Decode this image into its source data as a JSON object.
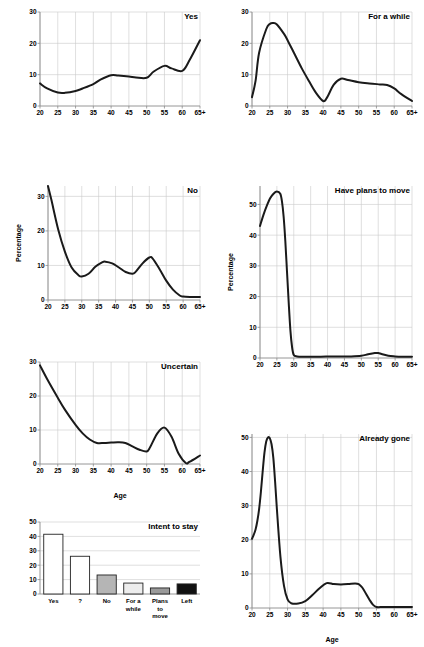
{
  "figure": {
    "axis_label_x": "Age",
    "axis_label_y": "Percentage",
    "line_color": "#1a1a1a",
    "grid_color": "#c9c9c9",
    "axis_color": "#8a8a8a"
  },
  "panels": [
    {
      "name": "yes",
      "title": "Yes",
      "xlabel": "",
      "ylabel": ""
    },
    {
      "name": "for-a-while",
      "title": "For a while",
      "xlabel": "",
      "ylabel": ""
    },
    {
      "name": "no",
      "title": "No",
      "xlabel": "",
      "ylabel": "Percentage"
    },
    {
      "name": "have-plans-to-move",
      "title": "Have plans to move",
      "xlabel": "",
      "ylabel": "Percentage"
    },
    {
      "name": "uncertain",
      "title": "Uncertain",
      "xlabel": "Age",
      "ylabel": ""
    },
    {
      "name": "intent-to-stay",
      "title": "Intent to stay",
      "xlabel": "",
      "ylabel": ""
    },
    {
      "name": "already-gone",
      "title": "Already gone",
      "xlabel": "Age",
      "ylabel": ""
    }
  ],
  "chart_data": [
    {
      "type": "line",
      "name": "yes",
      "title": "Yes",
      "xlabel": "",
      "ylabel": "Percentage",
      "xticklabels": [
        "20",
        "25",
        "30",
        "35",
        "40",
        "45",
        "50",
        "55",
        "60",
        "65+"
      ],
      "yticklabels": [
        "0",
        "10",
        "20",
        "30"
      ],
      "xlim": [
        20,
        65
      ],
      "ylim": [
        0,
        30
      ],
      "yticks": [
        0,
        10,
        20,
        30
      ],
      "xticks": [
        20,
        25,
        30,
        35,
        40,
        45,
        50,
        55,
        60,
        65
      ],
      "grid": true,
      "x": [
        20,
        22,
        25,
        27,
        30,
        32,
        35,
        37,
        40,
        42,
        45,
        47,
        50,
        52,
        55,
        57,
        60,
        62,
        65
      ],
      "y": [
        7.2,
        5.6,
        4.3,
        4.2,
        4.8,
        5.6,
        7.0,
        8.4,
        9.8,
        9.7,
        9.4,
        9.1,
        9.0,
        11.0,
        12.8,
        12.0,
        11.2,
        14.5,
        21.0
      ]
    },
    {
      "type": "line",
      "name": "for-a-while",
      "title": "For a while",
      "xlabel": "",
      "ylabel": "Percentage",
      "xticklabels": [
        "20",
        "25",
        "30",
        "35",
        "40",
        "45",
        "50",
        "55",
        "60",
        "65+"
      ],
      "yticklabels": [
        "0",
        "10",
        "20",
        "30"
      ],
      "xlim": [
        20,
        65
      ],
      "ylim": [
        0,
        30
      ],
      "yticks": [
        0,
        10,
        20,
        30
      ],
      "xticks": [
        20,
        25,
        30,
        35,
        40,
        45,
        50,
        55,
        60,
        65
      ],
      "grid": true,
      "x": [
        20,
        21,
        22,
        24,
        25,
        26,
        27,
        29,
        30,
        32,
        34,
        36,
        38,
        40,
        41,
        43,
        45,
        47,
        50,
        53,
        56,
        58,
        60,
        62,
        65
      ],
      "y": [
        2.8,
        8.0,
        17.0,
        24.5,
        26.2,
        26.5,
        26.0,
        23.0,
        21.0,
        16.5,
        12.0,
        8.0,
        4.2,
        1.6,
        2.5,
        6.8,
        8.7,
        8.3,
        7.6,
        7.2,
        6.9,
        6.7,
        5.6,
        3.8,
        1.6
      ]
    },
    {
      "type": "line",
      "name": "no",
      "title": "No",
      "xlabel": "",
      "ylabel": "Percentage",
      "xticklabels": [
        "20",
        "25",
        "30",
        "35",
        "40",
        "45",
        "50",
        "55",
        "60",
        "65+"
      ],
      "yticklabels": [
        "0",
        "10",
        "20",
        "30"
      ],
      "xlim": [
        20,
        65
      ],
      "ylim": [
        0,
        33
      ],
      "yticks": [
        0,
        10,
        20,
        30
      ],
      "xticks": [
        20,
        25,
        30,
        35,
        40,
        45,
        50,
        55,
        60,
        65
      ],
      "grid": true,
      "x": [
        20,
        21,
        23,
        25,
        27,
        29,
        30,
        32,
        34,
        36,
        37,
        39,
        41,
        43,
        45,
        46,
        48,
        50,
        51,
        53,
        55,
        57,
        59,
        60,
        62,
        65
      ],
      "y": [
        33.0,
        29.0,
        20.5,
        14.0,
        9.4,
        7.2,
        6.8,
        7.6,
        9.6,
        10.9,
        11.1,
        10.6,
        9.4,
        8.1,
        7.6,
        8.2,
        10.6,
        12.3,
        12.0,
        9.0,
        5.6,
        3.0,
        1.3,
        1.0,
        0.9,
        0.9
      ]
    },
    {
      "type": "line",
      "name": "have-plans-to-move",
      "title": "Have plans to move",
      "xlabel": "",
      "ylabel": "Percentage",
      "xticklabels": [
        "20",
        "25",
        "30",
        "35",
        "40",
        "45",
        "50",
        "55",
        "60",
        "65+"
      ],
      "yticklabels": [
        "0",
        "10",
        "20",
        "30",
        "40",
        "50"
      ],
      "xlim": [
        20,
        65
      ],
      "ylim": [
        0,
        56
      ],
      "yticks": [
        0,
        10,
        20,
        30,
        40,
        50
      ],
      "xticks": [
        20,
        25,
        30,
        35,
        40,
        45,
        50,
        55,
        60,
        65
      ],
      "grid": true,
      "x": [
        20,
        21,
        22,
        23,
        24,
        25,
        26,
        26.5,
        27,
        27.5,
        28,
        28.5,
        29,
        29.5,
        30,
        31,
        33,
        35,
        38,
        41,
        44,
        47,
        50,
        52,
        54,
        55,
        56,
        58,
        60,
        62,
        65
      ],
      "y": [
        43.0,
        46.5,
        49.5,
        52.0,
        53.5,
        54.2,
        53.5,
        51.0,
        46.0,
        38.0,
        28.0,
        18.0,
        9.0,
        3.5,
        1.0,
        0.5,
        0.4,
        0.4,
        0.4,
        0.5,
        0.5,
        0.5,
        0.7,
        1.2,
        1.6,
        1.6,
        1.3,
        0.7,
        0.5,
        0.4,
        0.4
      ]
    },
    {
      "type": "line",
      "name": "uncertain",
      "title": "Uncertain",
      "xlabel": "Age",
      "ylabel": "Percentage",
      "xticklabels": [
        "20",
        "25",
        "30",
        "35",
        "40",
        "45",
        "50",
        "55",
        "60",
        "65+"
      ],
      "yticklabels": [
        "0",
        "10",
        "20",
        "30"
      ],
      "xlim": [
        20,
        65
      ],
      "ylim": [
        0,
        30
      ],
      "yticks": [
        0,
        10,
        20,
        30
      ],
      "xticks": [
        20,
        25,
        30,
        35,
        40,
        45,
        50,
        55,
        60,
        65
      ],
      "grid": true,
      "x": [
        20,
        22,
        25,
        27,
        30,
        32,
        34,
        36,
        38,
        40,
        42,
        44,
        46,
        48,
        50,
        51,
        53,
        55,
        57,
        59,
        61,
        62,
        65
      ],
      "y": [
        29.0,
        25.0,
        19.5,
        16.0,
        11.5,
        9.0,
        7.2,
        6.2,
        6.2,
        6.3,
        6.4,
        6.2,
        5.2,
        4.2,
        3.7,
        5.0,
        9.0,
        10.7,
        8.0,
        3.0,
        0.3,
        0.6,
        2.5
      ]
    },
    {
      "type": "bar",
      "name": "intent-to-stay",
      "title": "Intent to stay",
      "xlabel": "",
      "ylabel": "Percentage",
      "categories": [
        "Yes",
        "?",
        "No",
        "For a\nwhile",
        "Plans\nto\nmove",
        "Left"
      ],
      "values": [
        41.5,
        26.2,
        13.2,
        7.6,
        4.2,
        7.0
      ],
      "bar_fills": [
        "#ffffff",
        "#ffffff",
        "#b5b5b5",
        "#ededed",
        "#9a9a9a",
        "#111111"
      ],
      "yticklabels": [
        "0",
        "10",
        "20",
        "30",
        "40",
        "50"
      ],
      "yticks": [
        0,
        10,
        20,
        30,
        40,
        50
      ],
      "ylim": [
        0,
        50
      ],
      "grid": true
    },
    {
      "type": "line",
      "name": "already-gone",
      "title": "Already gone",
      "xlabel": "Age",
      "ylabel": "Percentage",
      "xticklabels": [
        "20",
        "25",
        "30",
        "35",
        "40",
        "45",
        "50",
        "55",
        "60",
        "65+"
      ],
      "yticklabels": [
        "0",
        "10",
        "20",
        "30",
        "40",
        "50"
      ],
      "xlim": [
        20,
        65
      ],
      "ylim": [
        0,
        51
      ],
      "yticks": [
        0,
        10,
        20,
        30,
        40,
        50
      ],
      "xticks": [
        20,
        25,
        30,
        35,
        40,
        45,
        50,
        55,
        60,
        65
      ],
      "grid": true,
      "x": [
        20,
        20.5,
        21,
        21.5,
        22,
        22.5,
        23,
        23.5,
        24,
        24.5,
        25,
        25.5,
        26,
        26.5,
        27,
        28,
        29,
        30,
        31,
        33,
        35,
        37,
        39,
        41,
        43,
        45,
        47,
        49,
        50,
        51,
        53,
        54,
        55,
        57,
        60,
        62,
        65
      ],
      "y": [
        20.3,
        21.5,
        23.0,
        25.5,
        29.0,
        34.0,
        40.0,
        45.5,
        48.8,
        50.0,
        49.8,
        48.0,
        44.0,
        37.0,
        29.0,
        15.0,
        6.5,
        2.5,
        1.4,
        1.3,
        2.0,
        3.8,
        5.8,
        7.3,
        7.0,
        6.9,
        7.0,
        7.2,
        7.0,
        6.0,
        2.5,
        1.0,
        0.3,
        0.3,
        0.3,
        0.3,
        0.3
      ]
    }
  ]
}
